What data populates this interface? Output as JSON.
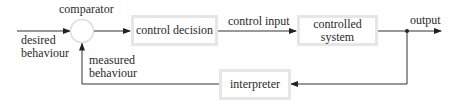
{
  "diagram": {
    "type": "feedback-control-loop",
    "nodes": {
      "comparator": {
        "label": "comparator",
        "shape": "circle"
      },
      "control_decision": {
        "label": "control decision",
        "shape": "box"
      },
      "controlled_system": {
        "label_line1": "controlled",
        "label_line2": "system",
        "shape": "box"
      },
      "interpreter": {
        "label": "interpreter",
        "shape": "box"
      }
    },
    "edges": {
      "desired": {
        "label_line1": "desired",
        "label_line2": "behaviour"
      },
      "control_input": {
        "label": "control input"
      },
      "output": {
        "label": "output"
      },
      "measured": {
        "label_line1": "measured",
        "label_line2": "behaviour"
      }
    },
    "colors": {
      "line": "#333333",
      "box_border": "#e6e6e6",
      "circle_border": "#dddddd",
      "text": "#2a2a2a"
    }
  }
}
